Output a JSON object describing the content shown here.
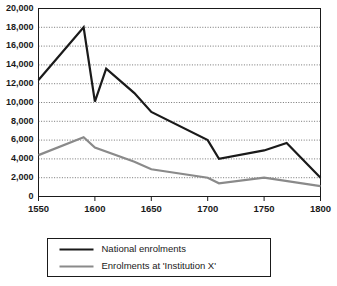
{
  "chart_data": {
    "type": "line",
    "title": "",
    "subtitle": "",
    "xlabel": "",
    "ylabel": "",
    "xlim": [
      1550,
      1800
    ],
    "ylim": [
      0,
      20000
    ],
    "grid": true,
    "grid_axis": "y",
    "legend_position": "bottom",
    "x_ticks": [
      1550,
      1600,
      1650,
      1700,
      1750,
      1800
    ],
    "x_tick_labels": [
      "1550",
      "1600",
      "1650",
      "1700",
      "1750",
      "1800"
    ],
    "y_ticks": [
      0,
      2000,
      4000,
      6000,
      8000,
      10000,
      12000,
      14000,
      16000,
      18000,
      20000
    ],
    "y_tick_labels": [
      "0",
      "2,000",
      "4,000",
      "6,000",
      "8,000",
      "10,000",
      "12,000",
      "14,000",
      "16,000",
      "18,000",
      "20,000"
    ],
    "series": [
      {
        "name": "National enrolments",
        "color": "#1a1a1a",
        "width": 2.2,
        "x": [
          1550,
          1590,
          1600,
          1610,
          1635,
          1650,
          1700,
          1710,
          1750,
          1770,
          1800
        ],
        "values": [
          12400,
          18000,
          10100,
          13600,
          11000,
          9000,
          6000,
          4000,
          4900,
          5700,
          2000
        ]
      },
      {
        "name": "Enrolments at 'Institution X'",
        "color": "#8a8a8a",
        "width": 2.2,
        "x": [
          1550,
          1590,
          1600,
          1635,
          1650,
          1700,
          1710,
          1750,
          1800
        ],
        "values": [
          4400,
          6300,
          5200,
          3700,
          2900,
          2000,
          1400,
          2000,
          1100
        ]
      }
    ]
  },
  "legend": {
    "entries": [
      {
        "label": "National enrolments",
        "color": "#1a1a1a"
      },
      {
        "label": "Enrolments at 'Institution X'",
        "color": "#8a8a8a"
      }
    ]
  }
}
